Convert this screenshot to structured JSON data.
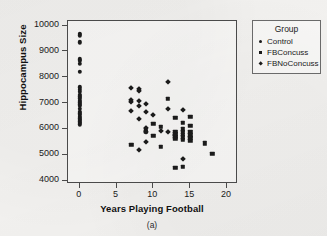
{
  "chart_data": {
    "type": "scatter",
    "title": "",
    "caption": "(a)",
    "xlabel": "Years Playing Football",
    "ylabel": "Hippocampus Size",
    "xlim": [
      -1.6,
      21.5
    ],
    "ylim": [
      3870,
      10180
    ],
    "xticks": [
      0,
      5,
      10,
      15,
      20
    ],
    "yticks": [
      4000,
      5000,
      6000,
      7000,
      8000,
      9000,
      10000
    ],
    "grid": false,
    "legend": {
      "title": "Group",
      "position": "right-outside",
      "entries": [
        {
          "name": "Control",
          "marker": "circle"
        },
        {
          "name": "FBConcuss",
          "marker": "square"
        },
        {
          "name": "FBNoConcuss",
          "marker": "diamond"
        }
      ]
    },
    "series": [
      {
        "name": "Control",
        "marker": "circle",
        "points": [
          [
            0,
            9690
          ],
          [
            0,
            9620
          ],
          [
            0,
            9350
          ],
          [
            0,
            8700
          ],
          [
            0,
            8630
          ],
          [
            0,
            8530
          ],
          [
            0,
            8210
          ],
          [
            0,
            7620
          ],
          [
            0,
            7520
          ],
          [
            0,
            7430
          ],
          [
            0,
            7330
          ],
          [
            0,
            7260
          ],
          [
            0,
            7180
          ],
          [
            0,
            7100
          ],
          [
            0,
            7030
          ],
          [
            0,
            6960
          ],
          [
            0,
            6900
          ],
          [
            0,
            6780
          ],
          [
            0,
            6660
          ],
          [
            0,
            6600
          ],
          [
            0,
            6540
          ],
          [
            0,
            6480
          ],
          [
            0,
            6420
          ],
          [
            0,
            6360
          ],
          [
            0,
            6300
          ],
          [
            0,
            6230
          ],
          [
            0,
            6180
          ]
        ]
      },
      {
        "name": "FBConcuss",
        "marker": "square",
        "points": [
          [
            7,
            5380
          ],
          [
            9,
            5950
          ],
          [
            9,
            5880
          ],
          [
            10,
            6200
          ],
          [
            10,
            5740
          ],
          [
            11,
            6090
          ],
          [
            11,
            5300
          ],
          [
            12,
            7160
          ],
          [
            13,
            6440
          ],
          [
            13,
            5900
          ],
          [
            13,
            5790
          ],
          [
            13,
            5700
          ],
          [
            13,
            5620
          ],
          [
            13,
            4500
          ],
          [
            14,
            6230
          ],
          [
            14,
            5980
          ],
          [
            14,
            5880
          ],
          [
            14,
            5780
          ],
          [
            14,
            5680
          ],
          [
            14,
            5580
          ],
          [
            14,
            4540
          ],
          [
            15,
            6470
          ],
          [
            15,
            6120
          ],
          [
            15,
            5880
          ],
          [
            15,
            5760
          ],
          [
            15,
            5660
          ],
          [
            15,
            5540
          ],
          [
            17,
            5450
          ],
          [
            18,
            5050
          ]
        ]
      },
      {
        "name": "FBNoConcuss",
        "marker": "diamond",
        "points": [
          [
            7,
            7600
          ],
          [
            7,
            7120
          ],
          [
            7,
            7040
          ],
          [
            7,
            6690
          ],
          [
            8,
            7530
          ],
          [
            8,
            7460
          ],
          [
            8,
            7070
          ],
          [
            8,
            6890
          ],
          [
            8,
            6390
          ],
          [
            8,
            5180
          ],
          [
            9,
            6950
          ],
          [
            9,
            6660
          ],
          [
            9,
            6030
          ],
          [
            9,
            5900
          ],
          [
            9,
            5500
          ],
          [
            10,
            6530
          ],
          [
            11,
            5940
          ],
          [
            12,
            7820
          ],
          [
            12,
            6780
          ],
          [
            12,
            5880
          ],
          [
            13,
            5770
          ],
          [
            14,
            6720
          ],
          [
            14,
            4840
          ]
        ]
      }
    ]
  }
}
